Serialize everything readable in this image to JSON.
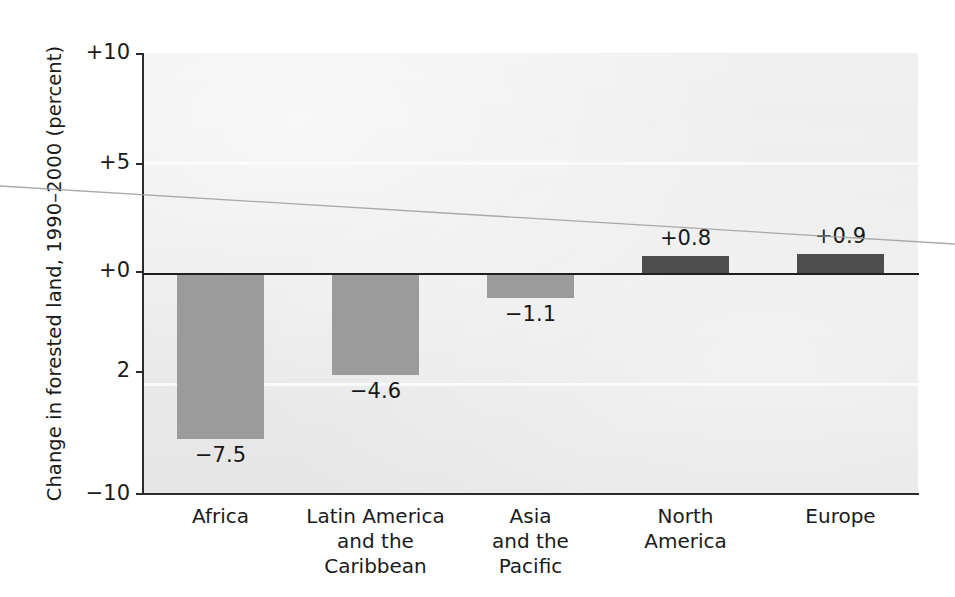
{
  "chart_data": {
    "type": "bar",
    "title": "",
    "xlabel": "",
    "ylabel": "Change in forested land, 1990–2000 (percent)",
    "categories": [
      "Africa",
      "Latin America and the Caribbean",
      "Asia and the Pacific",
      "North America",
      "Europe"
    ],
    "category_lines": [
      [
        "Africa"
      ],
      [
        "Latin America",
        "and the",
        "Caribbean"
      ],
      [
        "Asia",
        "and the",
        "Pacific"
      ],
      [
        "North",
        "America"
      ],
      [
        "Europe"
      ]
    ],
    "values": [
      -7.5,
      -4.6,
      -1.1,
      0.8,
      0.9
    ],
    "value_labels": [
      "−7.5",
      "−4.6",
      "−1.1",
      "+0.8",
      "+0.9"
    ],
    "bar_colors": [
      "#9b9b9b",
      "#9b9b9b",
      "#9b9b9b",
      "#4d4d4d",
      "#4d4d4d"
    ],
    "ylim": [
      -10,
      10
    ],
    "ytick_values": [
      10,
      5,
      0,
      -5,
      -10
    ],
    "ytick_labels": [
      "+10",
      "+5",
      "+0",
      "2",
      "−10"
    ],
    "grid": true,
    "gridline_values": [
      5,
      -5
    ],
    "legend": null,
    "plot_background": "#e8e8e8",
    "axis_color": "#2b2b2b",
    "zero_line_value": 0
  },
  "figure": {
    "artifact": "diagonal-scan-line"
  }
}
